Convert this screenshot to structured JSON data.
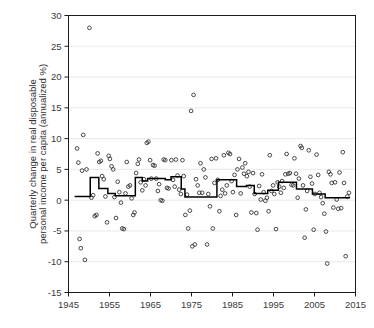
{
  "chart_data": {
    "type": "scatter",
    "title": "",
    "xlabel": "",
    "ylabel": "Quarterly change in real disposable personal income per capita (annualized %)",
    "ylabel_line1": "Quarterly change in real disposable",
    "ylabel_line2": "personal income per capita (annualized %)",
    "xlim": [
      1945,
      2015
    ],
    "ylim": [
      -15,
      30
    ],
    "xticks": [
      1945,
      1955,
      1965,
      1975,
      1985,
      1995,
      2005,
      2015
    ],
    "xtick_labels": [
      "1945",
      "1955",
      "1965",
      "1975",
      "1985",
      "1995",
      "2005",
      "2015"
    ],
    "yticks": [
      -15,
      -10,
      -5,
      0,
      5,
      10,
      15,
      20,
      25,
      30
    ],
    "ytick_labels": [
      "-15",
      "-10",
      "-5",
      "0",
      "5",
      "10",
      "15",
      "20",
      "25",
      "30"
    ],
    "grid": "horizontal",
    "legend": "none",
    "marker": "open-circle",
    "marker_color": "#2b2b2b",
    "line_color": "#000000",
    "series": [
      {
        "name": "Quarterly change (annualized %)",
        "type": "scatter",
        "points": [
          [
            1947.1,
            8.4
          ],
          [
            1947.4,
            6.1
          ],
          [
            1947.7,
            -6.3
          ],
          [
            1948.0,
            -7.8
          ],
          [
            1948.3,
            4.8
          ],
          [
            1948.6,
            10.6
          ],
          [
            1949.0,
            -9.7
          ],
          [
            1949.4,
            5.0
          ],
          [
            1950.1,
            28.0
          ],
          [
            1950.6,
            0.4
          ],
          [
            1951.0,
            0.8
          ],
          [
            1951.4,
            -2.6
          ],
          [
            1951.8,
            -2.4
          ],
          [
            1952.1,
            7.6
          ],
          [
            1952.5,
            6.2
          ],
          [
            1952.9,
            6.4
          ],
          [
            1953.2,
            3.9
          ],
          [
            1953.6,
            3.4
          ],
          [
            1954.0,
            0.6
          ],
          [
            1954.4,
            -3.6
          ],
          [
            1954.8,
            7.2
          ],
          [
            1955.1,
            6.7
          ],
          [
            1955.5,
            5.5
          ],
          [
            1955.9,
            5.0
          ],
          [
            1956.2,
            0.5
          ],
          [
            1956.6,
            -2.9
          ],
          [
            1957.0,
            3.0
          ],
          [
            1957.4,
            1.3
          ],
          [
            1957.8,
            -0.4
          ],
          [
            1958.1,
            -4.6
          ],
          [
            1958.5,
            -4.7
          ],
          [
            1958.9,
            1.1
          ],
          [
            1959.2,
            6.2
          ],
          [
            1959.6,
            2.2
          ],
          [
            1960.0,
            2.4
          ],
          [
            1960.4,
            0.3
          ],
          [
            1960.8,
            -2.4
          ],
          [
            1961.1,
            -2.0
          ],
          [
            1961.5,
            4.4
          ],
          [
            1961.9,
            5.9
          ],
          [
            1962.2,
            6.6
          ],
          [
            1962.6,
            2.9
          ],
          [
            1963.0,
            1.6
          ],
          [
            1963.4,
            3.4
          ],
          [
            1963.8,
            2.4
          ],
          [
            1964.1,
            9.3
          ],
          [
            1964.5,
            9.5
          ],
          [
            1964.9,
            6.5
          ],
          [
            1965.2,
            3.5
          ],
          [
            1965.6,
            5.7
          ],
          [
            1966.0,
            5.6
          ],
          [
            1966.4,
            3.5
          ],
          [
            1966.8,
            1.5
          ],
          [
            1967.1,
            2.6
          ],
          [
            1967.5,
            0.0
          ],
          [
            1967.9,
            -0.1
          ],
          [
            1968.2,
            6.6
          ],
          [
            1968.6,
            6.5
          ],
          [
            1969.0,
            2.0
          ],
          [
            1969.4,
            1.9
          ],
          [
            1970.1,
            6.5
          ],
          [
            1970.5,
            3.3
          ],
          [
            1970.9,
            2.2
          ],
          [
            1971.2,
            6.6
          ],
          [
            1971.6,
            4.0
          ],
          [
            1972.0,
            1.7
          ],
          [
            1972.4,
            1.0
          ],
          [
            1972.8,
            6.5
          ],
          [
            1973.1,
            3.9
          ],
          [
            1973.5,
            -2.4
          ],
          [
            1973.9,
            0.9
          ],
          [
            1974.2,
            -4.6
          ],
          [
            1974.6,
            -1.7
          ],
          [
            1974.9,
            14.5
          ],
          [
            1975.2,
            -7.5
          ],
          [
            1975.5,
            17.1
          ],
          [
            1975.8,
            -7.2
          ],
          [
            1976.1,
            3.4
          ],
          [
            1976.5,
            2.4
          ],
          [
            1976.9,
            1.2
          ],
          [
            1977.2,
            6.0
          ],
          [
            1977.6,
            1.2
          ],
          [
            1978.0,
            5.0
          ],
          [
            1978.4,
            3.7
          ],
          [
            1978.8,
            -7.2
          ],
          [
            1979.1,
            1.0
          ],
          [
            1979.5,
            -1.0
          ],
          [
            1979.9,
            6.7
          ],
          [
            1980.2,
            -4.6
          ],
          [
            1980.6,
            2.8
          ],
          [
            1981.0,
            6.8
          ],
          [
            1981.4,
            3.3
          ],
          [
            1981.8,
            -1.8
          ],
          [
            1982.1,
            0.7
          ],
          [
            1982.5,
            1.7
          ],
          [
            1982.9,
            7.3
          ],
          [
            1983.2,
            1.1
          ],
          [
            1983.6,
            2.4
          ],
          [
            1984.0,
            7.7
          ],
          [
            1984.4,
            7.5
          ],
          [
            1984.8,
            3.1
          ],
          [
            1985.1,
            1.3
          ],
          [
            1985.5,
            4.1
          ],
          [
            1985.9,
            -2.4
          ],
          [
            1986.2,
            5.0
          ],
          [
            1986.6,
            6.7
          ],
          [
            1987.0,
            1.1
          ],
          [
            1987.4,
            5.3
          ],
          [
            1987.8,
            4.3
          ],
          [
            1988.1,
            6.0
          ],
          [
            1988.5,
            3.9
          ],
          [
            1988.9,
            4.6
          ],
          [
            1989.2,
            2.2
          ],
          [
            1989.6,
            -2.0
          ],
          [
            1990.0,
            4.4
          ],
          [
            1990.4,
            1.0
          ],
          [
            1990.8,
            -2.1
          ],
          [
            1991.1,
            -4.8
          ],
          [
            1991.5,
            2.3
          ],
          [
            1991.9,
            0.1
          ],
          [
            1992.2,
            4.2
          ],
          [
            1992.6,
            1.3
          ],
          [
            1993.0,
            -0.1
          ],
          [
            1993.4,
            0.4
          ],
          [
            1993.8,
            -1.8
          ],
          [
            1994.1,
            7.3
          ],
          [
            1994.5,
            1.5
          ],
          [
            1994.9,
            2.4
          ],
          [
            1995.2,
            1.0
          ],
          [
            1995.6,
            -4.7
          ],
          [
            1996.0,
            2.9
          ],
          [
            1996.4,
            2.2
          ],
          [
            1996.8,
            1.2
          ],
          [
            1997.1,
            3.1
          ],
          [
            1997.5,
            2.0
          ],
          [
            1997.9,
            4.2
          ],
          [
            1998.2,
            7.5
          ],
          [
            1998.6,
            4.3
          ],
          [
            1999.0,
            4.4
          ],
          [
            1999.4,
            2.5
          ],
          [
            1999.8,
            2.4
          ],
          [
            2000.1,
            6.8
          ],
          [
            2000.5,
            4.3
          ],
          [
            2000.9,
            0.4
          ],
          [
            2001.2,
            3.5
          ],
          [
            2001.6,
            8.8
          ],
          [
            2001.9,
            8.5
          ],
          [
            2002.2,
            2.4
          ],
          [
            2002.6,
            -6.1
          ],
          [
            2002.9,
            -1.5
          ],
          [
            2003.2,
            1.5
          ],
          [
            2003.6,
            8.1
          ],
          [
            2004.0,
            3.8
          ],
          [
            2004.4,
            2.7
          ],
          [
            2004.8,
            -4.8
          ],
          [
            2005.1,
            1.0
          ],
          [
            2005.5,
            7.4
          ],
          [
            2005.9,
            4.1
          ],
          [
            2006.2,
            1.2
          ],
          [
            2006.6,
            0.5
          ],
          [
            2007.0,
            -0.5
          ],
          [
            2007.4,
            -2.2
          ],
          [
            2007.8,
            -5.1
          ],
          [
            2008.1,
            -10.3
          ],
          [
            2008.5,
            4.6
          ],
          [
            2008.9,
            4.2
          ],
          [
            2009.2,
            2.8
          ],
          [
            2009.6,
            -1.2
          ],
          [
            2010.0,
            2.9
          ],
          [
            2010.4,
            0.1
          ],
          [
            2010.8,
            -1.4
          ],
          [
            2011.1,
            4.5
          ],
          [
            2011.5,
            -1.3
          ],
          [
            2011.9,
            7.8
          ],
          [
            2012.2,
            2.8
          ],
          [
            2012.6,
            -9.1
          ],
          [
            2013.0,
            0.6
          ],
          [
            2013.4,
            1.2
          ]
        ]
      },
      {
        "name": "Trend (step function)",
        "type": "step",
        "steps": [
          [
            1946.5,
            1950.3,
            0.6
          ],
          [
            1950.3,
            1952.4,
            3.7
          ],
          [
            1952.4,
            1954.6,
            1.9
          ],
          [
            1954.6,
            1956.4,
            1.1
          ],
          [
            1956.4,
            1961.3,
            0.7
          ],
          [
            1961.3,
            1963.0,
            3.7
          ],
          [
            1963.0,
            1964.3,
            3.1
          ],
          [
            1964.3,
            1968.6,
            3.5
          ],
          [
            1968.6,
            1970.0,
            3.3
          ],
          [
            1970.0,
            1972.5,
            3.8
          ],
          [
            1972.5,
            1973.4,
            1.8
          ],
          [
            1973.4,
            1981.2,
            0.5
          ],
          [
            1981.2,
            1986.0,
            3.3
          ],
          [
            1986.0,
            1988.4,
            2.2
          ],
          [
            1988.4,
            1990.3,
            2.4
          ],
          [
            1990.3,
            1993.6,
            1.1
          ],
          [
            1993.6,
            1996.2,
            1.6
          ],
          [
            1996.2,
            2000.6,
            2.9
          ],
          [
            2000.6,
            2004.5,
            1.8
          ],
          [
            2004.5,
            2007.6,
            1.0
          ],
          [
            2007.6,
            2013.7,
            0.4
          ]
        ]
      }
    ]
  }
}
